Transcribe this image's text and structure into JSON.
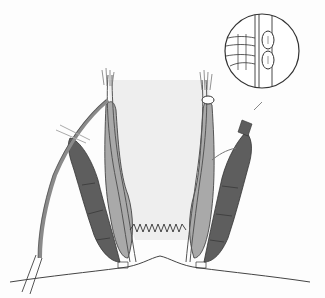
{
  "figure": {
    "type": "anatomical-illustration",
    "labels": [],
    "colors": {
      "background": "#fdfdfd",
      "lumen_shading": "#eeeeee",
      "external_sphincter": "#5e5e5e",
      "internal_sphincter": "#a9a9a9",
      "outline": "#333333",
      "muscle_strand": "#8a8a8a"
    },
    "inset": {
      "shape": "circle",
      "content": "magnified-detail-two-round-structures"
    }
  }
}
